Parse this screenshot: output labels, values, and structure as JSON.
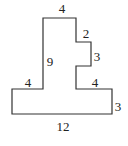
{
  "diagram": {
    "type": "rectilinear-polygon",
    "stroke_color": "#333333",
    "vertices": [
      [
        43,
        18
      ],
      [
        76,
        18
      ],
      [
        76,
        42
      ],
      [
        91,
        42
      ],
      [
        91,
        66
      ],
      [
        76,
        66
      ],
      [
        76,
        89
      ],
      [
        112,
        89
      ],
      [
        112,
        114
      ],
      [
        12,
        114
      ],
      [
        12,
        89
      ],
      [
        43,
        89
      ]
    ],
    "labels": {
      "top_width": "4",
      "step_width": "2",
      "step_height": "3",
      "tall_height": "9",
      "left_ledge": "4",
      "right_ledge": "4",
      "base_height": "3",
      "base_width": "12"
    }
  }
}
